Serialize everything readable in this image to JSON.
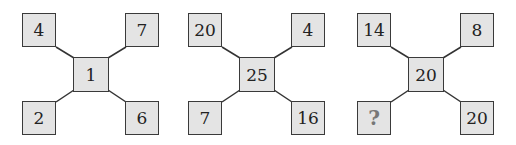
{
  "puzzle": {
    "groups": [
      {
        "top_left": "4",
        "top_right": "7",
        "center": "1",
        "bottom_left": "2",
        "bottom_right": "6"
      },
      {
        "top_left": "20",
        "top_right": "4",
        "center": "25",
        "bottom_left": "7",
        "bottom_right": "16"
      },
      {
        "top_left": "14",
        "top_right": "8",
        "center": "20",
        "bottom_left": "?",
        "bottom_right": "20"
      }
    ],
    "colors": {
      "box_fill": "#e4e4e4",
      "border": "#3a3a3a",
      "question_mark": "#777777"
    }
  }
}
